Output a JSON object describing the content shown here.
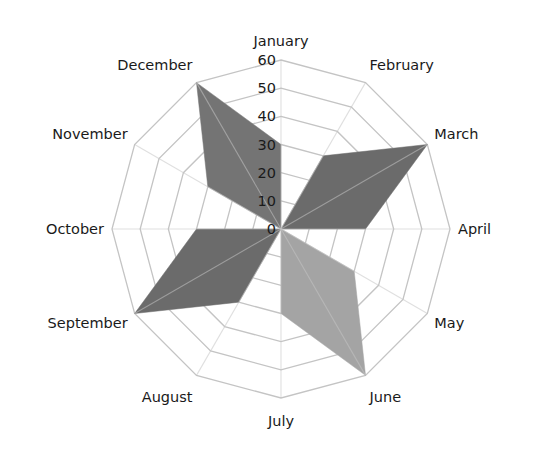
{
  "chart_data": {
    "type": "radar",
    "title": "",
    "categories": [
      "January",
      "February",
      "March",
      "April",
      "May",
      "June",
      "July",
      "August",
      "September",
      "October",
      "November",
      "December"
    ],
    "series": [
      {
        "name": "Series A (March)",
        "color": "#6b6b6b",
        "values": [
          0,
          30,
          60,
          30,
          0,
          0,
          0,
          0,
          0,
          0,
          0,
          0
        ]
      },
      {
        "name": "Series B (June)",
        "color": "#a4a4a4",
        "values": [
          0,
          0,
          0,
          0,
          30,
          60,
          30,
          0,
          0,
          0,
          0,
          0
        ]
      },
      {
        "name": "Series C (September)",
        "color": "#6b6b6b",
        "values": [
          0,
          0,
          0,
          0,
          0,
          0,
          0,
          30,
          60,
          30,
          0,
          0
        ]
      },
      {
        "name": "Series D (December)",
        "color": "#747474",
        "values": [
          30,
          0,
          0,
          0,
          0,
          0,
          0,
          0,
          0,
          0,
          30,
          60
        ]
      }
    ],
    "ticks": [
      "0",
      "10",
      "20",
      "30",
      "40",
      "50",
      "60"
    ],
    "rlim": [
      0,
      60
    ],
    "grid": true,
    "legend": "none"
  },
  "layout": {
    "center": [
      281,
      229
    ],
    "radius": 169,
    "grid_color": "#c4c4c4"
  }
}
